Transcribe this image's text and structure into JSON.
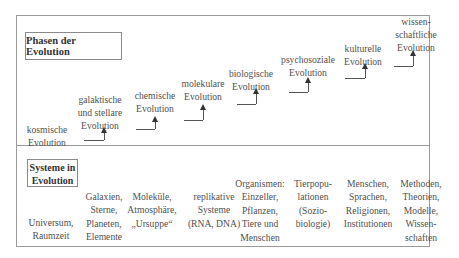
{
  "phases": {
    "title": "Phasen der Evolution",
    "items": [
      {
        "label": "kosmische\nEvolution"
      },
      {
        "label": "galaktische\nund stellare\nEvolution"
      },
      {
        "label": "chemische\nEvolution"
      },
      {
        "label": "molekulare\nEvolution"
      },
      {
        "label": "biologische\nEvolution"
      },
      {
        "label": "psychosoziale\nEvolution"
      },
      {
        "label": "kulturelle\nEvolution"
      },
      {
        "label": "wissen-\nschaftliche\nEvolution"
      }
    ]
  },
  "systems": {
    "title": "Systeme in\nEvolution",
    "items": [
      {
        "label": "Universum,\nRaumzeit"
      },
      {
        "label": "Galaxien,\nSterne,\nPlaneten,\nElemente"
      },
      {
        "label": "Moleküle,\nAtmosphäre,\n„Ursuppe“"
      },
      {
        "label": "replikative\nSysteme\n(RNA, DNA)"
      },
      {
        "label": "Organismen:\nEinzeller,\nPflanzen,\nTiere und\nMenschen"
      },
      {
        "label": "Tierpopu-\nlationen\n(Sozio-\nbiologie)"
      },
      {
        "label": "Menschen,\nSprachen,\nReligionen,\nInstitutionen"
      },
      {
        "label": "Methoden,\nTheorien,\nModelle,\nWissen-\nschaften"
      }
    ]
  }
}
